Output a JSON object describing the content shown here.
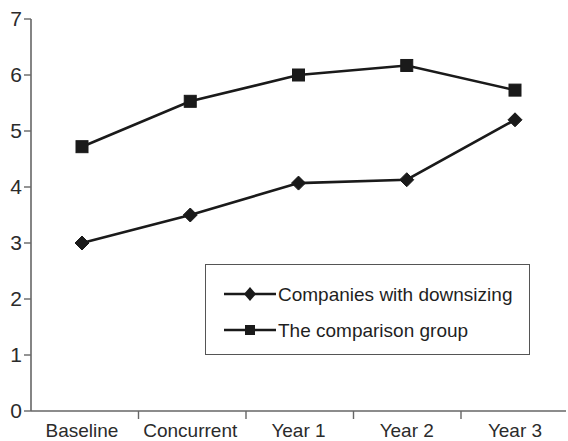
{
  "chart_data": {
    "type": "line",
    "title": "",
    "subtitle": "",
    "xlabel": "",
    "ylabel": "",
    "categories": [
      "Baseline",
      "Concurrent",
      "Year 1",
      "Year 2",
      "Year 3"
    ],
    "series": [
      {
        "name": "Companies with downsizing",
        "marker": "diamond",
        "color": "#1a1a1a",
        "values": [
          3.0,
          3.5,
          4.07,
          4.13,
          5.2
        ]
      },
      {
        "name": "The comparison group",
        "marker": "square",
        "color": "#1a1a1a",
        "values": [
          4.72,
          5.53,
          6.0,
          6.17,
          5.73
        ]
      }
    ],
    "ylim": [
      0,
      7
    ],
    "ytick_labels": [
      "7",
      "6",
      "5",
      "4",
      "3",
      "2",
      "1",
      "0"
    ],
    "ytick_values": [
      7,
      6,
      5,
      4,
      3,
      2,
      1,
      0
    ],
    "grid": false,
    "legend_position": "inside-bottom-right",
    "axis_color": "#666666"
  },
  "legend": {
    "entries": [
      {
        "label": "Companies with downsizing",
        "marker": "diamond-marker-icon"
      },
      {
        "label": "The comparison group",
        "marker": "square-marker-icon"
      }
    ]
  }
}
